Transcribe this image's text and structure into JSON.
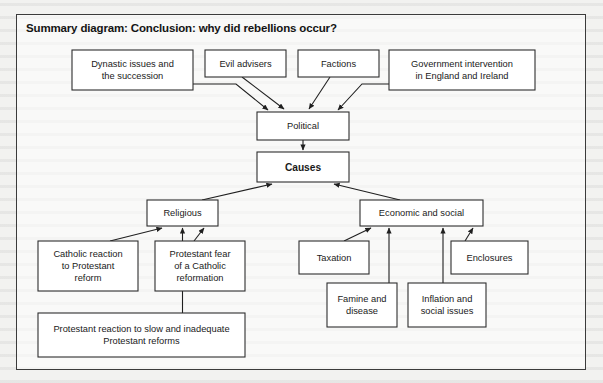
{
  "page": {
    "background_color": "#f2f2f0",
    "frame_border_color": "#3b3b3b"
  },
  "header": {
    "title": "Summary diagram: Conclusion: why did rebellions occur?"
  },
  "diagram": {
    "type": "flowchart",
    "orientation": "converging-hierarchy",
    "central_node": "Causes",
    "nodes": [
      {
        "id": "dynastic",
        "label": "Dynastic issues and\nthe succession",
        "x": 72,
        "y": 50,
        "w": 121,
        "h": 40,
        "bold": false,
        "tier": "political-cause"
      },
      {
        "id": "evil-advisers",
        "label": "Evil advisers",
        "x": 205,
        "y": 50,
        "w": 81,
        "h": 27,
        "bold": false,
        "tier": "political-cause"
      },
      {
        "id": "factions",
        "label": "Factions",
        "x": 298,
        "y": 50,
        "w": 81,
        "h": 27,
        "bold": false,
        "tier": "political-cause"
      },
      {
        "id": "government",
        "label": "Government intervention\nin England and Ireland",
        "x": 389,
        "y": 50,
        "w": 146,
        "h": 40,
        "bold": false,
        "tier": "political-cause"
      },
      {
        "id": "political",
        "label": "Political",
        "x": 257,
        "y": 112,
        "w": 92,
        "h": 28,
        "bold": false,
        "tier": "category"
      },
      {
        "id": "causes",
        "label": "Causes",
        "x": 257,
        "y": 152,
        "w": 92,
        "h": 30,
        "bold": true,
        "tier": "root"
      },
      {
        "id": "religious",
        "label": "Religious",
        "x": 147,
        "y": 200,
        "w": 71,
        "h": 26,
        "bold": false,
        "tier": "category"
      },
      {
        "id": "economic",
        "label": "Economic and social",
        "x": 360,
        "y": 200,
        "w": 123,
        "h": 26,
        "bold": false,
        "tier": "category"
      },
      {
        "id": "catholic",
        "label": "Catholic reaction\nto Protestant\nreform",
        "x": 38,
        "y": 241,
        "w": 100,
        "h": 50,
        "bold": false,
        "tier": "religious-cause"
      },
      {
        "id": "protestant-fear",
        "label": "Protestant fear\nof a Catholic\nreformation",
        "x": 155,
        "y": 241,
        "w": 90,
        "h": 50,
        "bold": false,
        "tier": "religious-cause"
      },
      {
        "id": "protestant-reaction",
        "label": "Protestant reaction to slow and inadequate\nProtestant reforms",
        "x": 38,
        "y": 313,
        "w": 207,
        "h": 44,
        "bold": false,
        "tier": "religious-cause"
      },
      {
        "id": "taxation",
        "label": "Taxation",
        "x": 299,
        "y": 241,
        "w": 70,
        "h": 33,
        "bold": false,
        "tier": "economic-cause"
      },
      {
        "id": "enclosures",
        "label": "Enclosures",
        "x": 451,
        "y": 241,
        "w": 77,
        "h": 33,
        "bold": false,
        "tier": "economic-cause"
      },
      {
        "id": "famine",
        "label": "Famine and\ndisease",
        "x": 327,
        "y": 283,
        "w": 70,
        "h": 44,
        "bold": false,
        "tier": "economic-cause"
      },
      {
        "id": "inflation",
        "label": "Inflation and\nsocial issues",
        "x": 408,
        "y": 283,
        "w": 78,
        "h": 44,
        "bold": false,
        "tier": "economic-cause"
      }
    ],
    "edges": [
      {
        "from": "dynastic",
        "to": "political",
        "arrow": true
      },
      {
        "from": "evil-advisers",
        "to": "political",
        "arrow": true
      },
      {
        "from": "factions",
        "to": "political",
        "arrow": true
      },
      {
        "from": "government",
        "to": "political",
        "arrow": true
      },
      {
        "from": "political",
        "to": "causes",
        "arrow": true
      },
      {
        "from": "religious",
        "to": "causes",
        "arrow": true
      },
      {
        "from": "economic",
        "to": "causes",
        "arrow": true
      },
      {
        "from": "catholic",
        "to": "religious",
        "arrow": true
      },
      {
        "from": "protestant-fear",
        "to": "religious",
        "arrow": true
      },
      {
        "from": "protestant-reaction",
        "to": "religious",
        "arrow": true
      },
      {
        "from": "taxation",
        "to": "economic",
        "arrow": true
      },
      {
        "from": "famine",
        "to": "economic",
        "arrow": true
      },
      {
        "from": "inflation",
        "to": "economic",
        "arrow": true
      },
      {
        "from": "enclosures",
        "to": "economic",
        "arrow": true
      }
    ]
  }
}
